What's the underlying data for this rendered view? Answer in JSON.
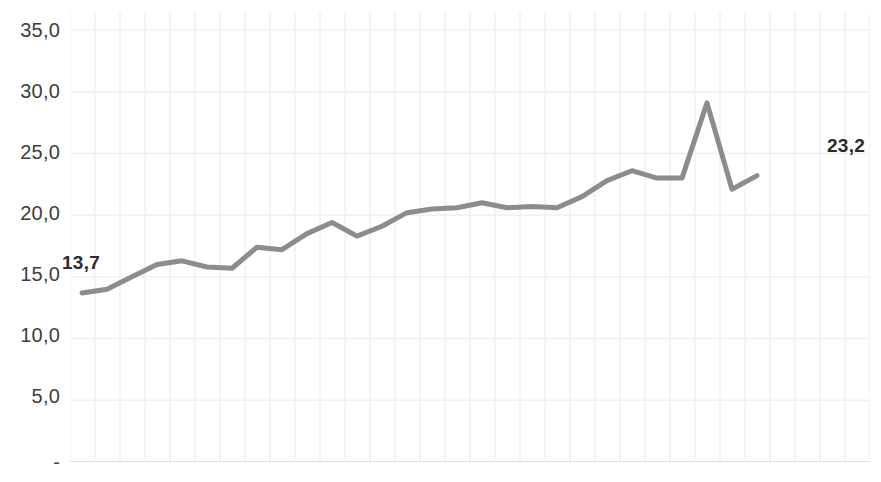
{
  "chart_data": {
    "type": "line",
    "title": "",
    "subtitle": "",
    "xlabel": "",
    "ylabel": "",
    "ylim": [
      0,
      35
    ],
    "y_ticks": [
      35.0,
      30.0,
      25.0,
      20.0,
      15.0,
      10.0,
      5.0,
      0
    ],
    "y_tick_labels": [
      "35,0",
      "30,0",
      "25,0",
      "20,0",
      "15,0",
      "10,0",
      "5,0",
      "-"
    ],
    "x_tick_labels": [],
    "grid": {
      "horizontal": true,
      "vertical": true,
      "color": "#f0f0f0"
    },
    "legend": {
      "visible": false,
      "position": "none"
    },
    "decimal_separator": ",",
    "series": [
      {
        "name": "series-1",
        "color": "#8c8c8c",
        "line_width": 5,
        "x": [
          0,
          1,
          2,
          3,
          4,
          5,
          6,
          7,
          8,
          9,
          10,
          11,
          12,
          13,
          14,
          15,
          16,
          17,
          18,
          19,
          20,
          21,
          22,
          23,
          24,
          25,
          26,
          27
        ],
        "values": [
          13.7,
          14.0,
          15.0,
          16.0,
          16.3,
          15.8,
          15.7,
          17.4,
          17.2,
          18.5,
          19.4,
          18.3,
          19.1,
          20.2,
          20.5,
          20.6,
          21.0,
          20.6,
          20.7,
          20.6,
          21.5,
          22.8,
          23.6,
          23.0,
          23.0,
          29.1,
          22.1,
          23.2
        ]
      }
    ],
    "annotations": [
      {
        "id": "first",
        "text": "13,7",
        "value": 13.7,
        "point_index": 0,
        "bold": true,
        "color": "#2b2b2b"
      },
      {
        "id": "last",
        "text": "23,2",
        "value": 23.2,
        "point_index": 27,
        "bold": true,
        "color": "#2b2b2b"
      }
    ]
  },
  "axis": {
    "baseline_color": "#d9d9d9",
    "gridline_color": "#f2f2f2"
  }
}
